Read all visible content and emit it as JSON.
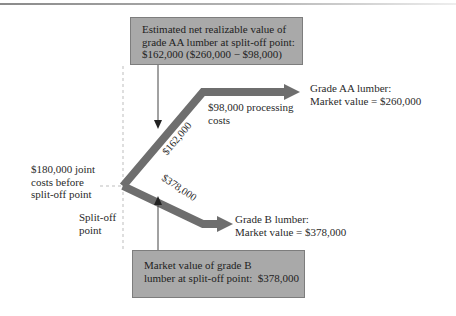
{
  "diagram": {
    "top_box": {
      "lines": [
        "Estimated net realizable value of",
        "grade AA lumber at split-off point:",
        "$162,000 ($260,000 − $98,000)"
      ]
    },
    "bottom_box": {
      "lines": [
        "Market value of grade B",
        "lumber at split-off point:  $378,000"
      ]
    },
    "joint_costs": {
      "lines": [
        "$180,000 joint",
        "costs before",
        "split-off point"
      ]
    },
    "split_off": {
      "lines": [
        "Split-off",
        "point"
      ]
    },
    "upper_branch": {
      "arm_label": "$162,000",
      "processing_lines": [
        "$98,000 processing",
        "costs"
      ],
      "product_lines": [
        "Grade AA lumber:",
        "Market value = $260,000"
      ]
    },
    "lower_branch": {
      "arm_label": "$378,000",
      "product_lines": [
        "Grade B lumber:",
        "Market value = $378,000"
      ]
    },
    "colors": {
      "arrow_fill": "#6e6e6e",
      "box_fill": "#a9a9a9",
      "dashed_line": "#bdbdbd"
    }
  }
}
